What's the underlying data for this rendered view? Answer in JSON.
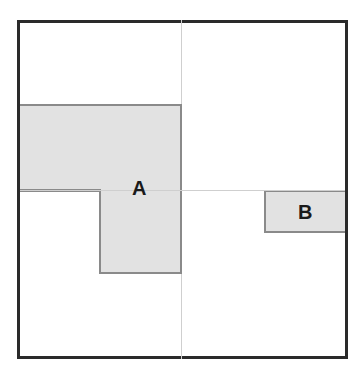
{
  "diagram": {
    "type": "spatial-layout",
    "frame": {
      "stroke": "#2a2a2a",
      "fill": "#ffffff"
    },
    "guides": {
      "vertical_center": true,
      "horizontal_center": true,
      "color": "#cfcfcf"
    },
    "shapes": [
      {
        "id": "A",
        "label": "A",
        "fill": "#e2e2e2",
        "stroke": "#8a8a8a",
        "description": "L-shaped region: wide block in upper-left quadrant plus block below it spanning center"
      },
      {
        "id": "B",
        "label": "B",
        "fill": "#e2e2e2",
        "stroke": "#8a8a8a",
        "description": "small rectangle on right edge just below horizontal center line"
      }
    ]
  }
}
